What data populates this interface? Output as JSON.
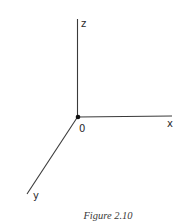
{
  "figure": {
    "caption": "Figure 2.10",
    "origin_label": "0",
    "axes": [
      {
        "name": "x",
        "label": "x",
        "direction": "right"
      },
      {
        "name": "y",
        "label": "y",
        "direction": "down-left (toward viewer)"
      },
      {
        "name": "z",
        "label": "z",
        "direction": "up"
      }
    ]
  },
  "colors": {
    "line": "#3a3a3a",
    "text": "#2a2a2a",
    "background": "#ffffff"
  }
}
